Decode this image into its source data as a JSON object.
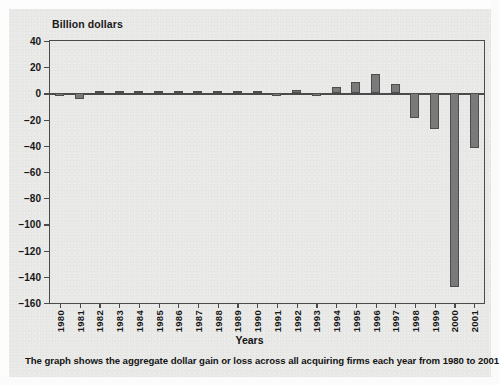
{
  "chart_data": {
    "type": "bar",
    "title": "Billion dollars",
    "subtitle": "",
    "xlabel": "Years",
    "ylabel": "Billion dollars",
    "ylim": [
      -160,
      40
    ],
    "yticks": [
      40,
      20,
      0,
      -20,
      -40,
      -60,
      -80,
      -100,
      -120,
      -140,
      -160
    ],
    "ytick_labels": [
      "40",
      "20",
      "0",
      "−20",
      "−40",
      "−60",
      "−80",
      "−100",
      "−120",
      "−140",
      "−160"
    ],
    "grid": false,
    "legend": null,
    "bar_color": "#7a7a7a",
    "bar_edge_color": "#4d4d4d",
    "categories": [
      "1980",
      "1981",
      "1982",
      "1983",
      "1984",
      "1985",
      "1986",
      "1987",
      "1988",
      "1989",
      "1990",
      "1991",
      "1992",
      "1993",
      "1994",
      "1995",
      "1996",
      "1997",
      "1998",
      "1999",
      "2000",
      "2001"
    ],
    "values": [
      -2,
      -4,
      0.8,
      0.8,
      1,
      1,
      1,
      1.2,
      1,
      2,
      2,
      -1.5,
      2.5,
      -2,
      5,
      9,
      15,
      7,
      -19,
      -27,
      -148,
      -42
    ],
    "annotations": []
  },
  "caption": {
    "text": "The graph shows the aggregate dollar gain or loss across all acquiring firms each year from 1980 to 2001."
  }
}
